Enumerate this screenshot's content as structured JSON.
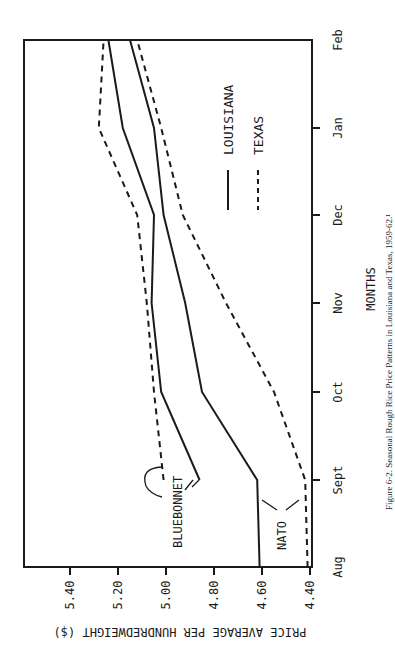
{
  "chart_data": {
    "type": "line",
    "orientation": "rotated-90-ccw",
    "title": "",
    "caption": "Figure 6-2.  Seasonal Rough Rice Price Patterns in Louisiana and Texas, 1959-62.¹",
    "xlabel": "MONTHS",
    "ylabel": "PRICE AVERAGE PER HUNDREDWEIGHT ($)",
    "categories": [
      "Aug",
      "Sept",
      "Oct",
      "Nov",
      "Dec",
      "Jan",
      "Feb"
    ],
    "yticks": [
      "4.40",
      "4.60",
      "4.80",
      "5.00",
      "5.20",
      "5.40"
    ],
    "ylim": [
      4.39,
      5.59
    ],
    "grid": false,
    "legend": {
      "position": "upper-right (in rotated frame)",
      "entries": [
        {
          "label": "LOUISIANA",
          "style": "solid"
        },
        {
          "label": "TEXAS",
          "style": "dashed"
        }
      ]
    },
    "annotations": [
      {
        "text": "BLUEBONNET",
        "refers_to": [
          "Louisiana Bluebonnet",
          "Texas Bluebonnet"
        ]
      },
      {
        "text": "NATO",
        "refers_to": [
          "Louisiana Nato",
          "Texas Nato"
        ]
      }
    ],
    "series": [
      {
        "name": "Louisiana Bluebonnet",
        "state": "LOUISIANA",
        "variety": "BLUEBONNET",
        "style": "solid",
        "values": [
          null,
          4.86,
          5.02,
          5.06,
          5.05,
          5.18,
          5.24
        ]
      },
      {
        "name": "Texas Bluebonnet",
        "state": "TEXAS",
        "variety": "BLUEBONNET",
        "style": "dashed",
        "values": [
          null,
          5.01,
          5.05,
          5.08,
          5.12,
          5.28,
          5.26
        ]
      },
      {
        "name": "Louisiana Nato",
        "state": "LOUISIANA",
        "variety": "NATO",
        "style": "solid",
        "values": [
          4.61,
          4.62,
          4.85,
          4.92,
          5.01,
          5.05,
          5.15
        ]
      },
      {
        "name": "Texas Nato",
        "state": "TEXAS",
        "variety": "NATO",
        "style": "dashed",
        "values": [
          4.41,
          4.42,
          4.55,
          4.75,
          4.93,
          5.02,
          5.12
        ]
      }
    ]
  },
  "colors": {
    "ink": "#1a1a1a",
    "background": "#ffffff"
  }
}
